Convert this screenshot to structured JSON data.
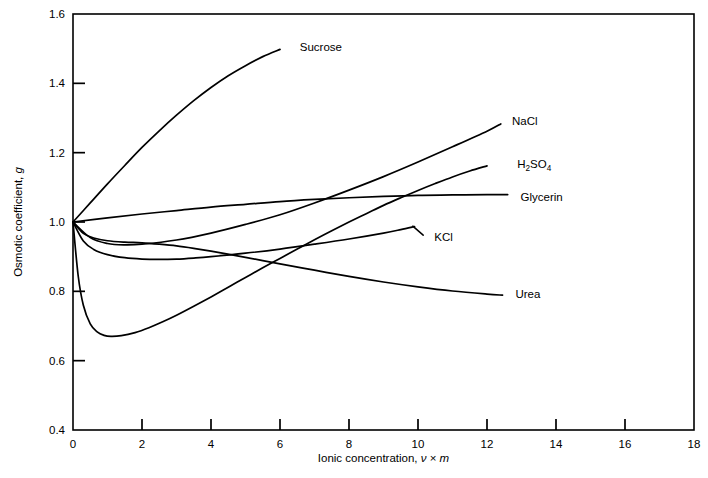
{
  "chart_data": {
    "type": "line",
    "title": "",
    "xlabel": "Ionic concentration, ν × m",
    "ylabel": "Osmotic coefficient, g",
    "xlim": [
      0,
      18
    ],
    "ylim": [
      0.4,
      1.6
    ],
    "xticks": [
      0,
      2,
      4,
      6,
      8,
      10,
      12,
      14,
      16,
      18
    ],
    "yticks": [
      0.4,
      0.6,
      0.8,
      1.0,
      1.2,
      1.4,
      1.6
    ],
    "xtick_labels": [
      "0",
      "2",
      "4",
      "6",
      "8",
      "10",
      "12",
      "14",
      "16",
      "18"
    ],
    "ytick_labels": [
      "0.4",
      "0.6",
      "0.8",
      "1.0",
      "1.2",
      "1.4",
      "1.6"
    ],
    "grid": false,
    "legend_position": "inline-labels-at-curve-ends",
    "line_color": "#000000",
    "series": [
      {
        "name": "Sucrose",
        "label": "Sucrose",
        "label_x": 6.4,
        "label_y": 1.505,
        "leader": false,
        "points": [
          [
            0.0,
            1.0
          ],
          [
            0.5,
            1.055
          ],
          [
            1.0,
            1.11
          ],
          [
            1.5,
            1.163
          ],
          [
            2.0,
            1.215
          ],
          [
            2.5,
            1.263
          ],
          [
            3.0,
            1.308
          ],
          [
            3.5,
            1.35
          ],
          [
            4.0,
            1.388
          ],
          [
            4.5,
            1.422
          ],
          [
            5.0,
            1.451
          ],
          [
            5.5,
            1.477
          ],
          [
            6.0,
            1.498
          ]
        ]
      },
      {
        "name": "NaCl",
        "label": "NaCl",
        "label_x": 12.55,
        "label_y": 1.292,
        "leader": false,
        "points": [
          [
            0.0,
            1.0
          ],
          [
            0.5,
            0.955
          ],
          [
            1.0,
            0.938
          ],
          [
            1.5,
            0.934
          ],
          [
            2.0,
            0.936
          ],
          [
            3.0,
            0.948
          ],
          [
            4.0,
            0.968
          ],
          [
            5.0,
            0.993
          ],
          [
            6.0,
            1.021
          ],
          [
            7.0,
            1.055
          ],
          [
            8.0,
            1.092
          ],
          [
            9.0,
            1.131
          ],
          [
            10.0,
            1.173
          ],
          [
            11.0,
            1.217
          ],
          [
            12.0,
            1.262
          ],
          [
            12.4,
            1.283
          ]
        ]
      },
      {
        "name": "H2SO4",
        "label": "H₂SO₄",
        "label_html": "H<sub>2</sub>SO<sub>4</sub>",
        "label_x": 12.7,
        "label_y": 1.168,
        "leader": false,
        "points": [
          [
            0.0,
            1.0
          ],
          [
            0.15,
            0.845
          ],
          [
            0.3,
            0.76
          ],
          [
            0.5,
            0.706
          ],
          [
            0.7,
            0.683
          ],
          [
            0.9,
            0.673
          ],
          [
            1.1,
            0.67
          ],
          [
            1.4,
            0.672
          ],
          [
            1.8,
            0.681
          ],
          [
            2.2,
            0.695
          ],
          [
            2.6,
            0.712
          ],
          [
            3.0,
            0.731
          ],
          [
            3.5,
            0.757
          ],
          [
            4.0,
            0.784
          ],
          [
            4.5,
            0.812
          ],
          [
            5.0,
            0.84
          ],
          [
            5.5,
            0.868
          ],
          [
            6.0,
            0.895
          ],
          [
            6.5,
            0.922
          ],
          [
            7.0,
            0.949
          ],
          [
            7.5,
            0.975
          ],
          [
            8.0,
            1.0
          ],
          [
            8.5,
            1.024
          ],
          [
            9.0,
            1.048
          ],
          [
            9.5,
            1.07
          ],
          [
            10.0,
            1.091
          ],
          [
            10.5,
            1.111
          ],
          [
            11.0,
            1.13
          ],
          [
            11.5,
            1.147
          ],
          [
            12.0,
            1.162
          ]
        ]
      },
      {
        "name": "Glycerin",
        "label": "Glycerin",
        "label_x": 12.8,
        "label_y": 1.073,
        "leader": false,
        "points": [
          [
            0.0,
            1.0
          ],
          [
            1.0,
            1.012
          ],
          [
            2.0,
            1.023
          ],
          [
            3.0,
            1.033
          ],
          [
            4.0,
            1.043
          ],
          [
            5.0,
            1.051
          ],
          [
            6.0,
            1.059
          ],
          [
            7.0,
            1.065
          ],
          [
            8.0,
            1.07
          ],
          [
            9.0,
            1.074
          ],
          [
            10.0,
            1.077
          ],
          [
            11.0,
            1.078
          ],
          [
            12.0,
            1.079
          ],
          [
            12.6,
            1.079
          ]
        ]
      },
      {
        "name": "KCl",
        "label": "KCl",
        "label_x": 10.3,
        "label_y": 0.957,
        "leader": true,
        "leader_from": [
          9.85,
          0.988
        ],
        "leader_to": [
          10.15,
          0.962
        ],
        "points": [
          [
            0.0,
            1.0
          ],
          [
            0.3,
            0.945
          ],
          [
            0.6,
            0.921
          ],
          [
            1.0,
            0.906
          ],
          [
            1.5,
            0.897
          ],
          [
            2.0,
            0.893
          ],
          [
            2.5,
            0.892
          ],
          [
            3.0,
            0.893
          ],
          [
            3.5,
            0.896
          ],
          [
            4.0,
            0.9
          ],
          [
            5.0,
            0.91
          ],
          [
            6.0,
            0.922
          ],
          [
            7.0,
            0.936
          ],
          [
            8.0,
            0.951
          ],
          [
            9.0,
            0.968
          ],
          [
            9.5,
            0.978
          ],
          [
            9.9,
            0.987
          ]
        ]
      },
      {
        "name": "Urea",
        "label": "Urea",
        "label_x": 12.65,
        "label_y": 0.793,
        "leader": false,
        "points": [
          [
            0.0,
            1.0
          ],
          [
            0.3,
            0.967
          ],
          [
            0.6,
            0.954
          ],
          [
            1.0,
            0.946
          ],
          [
            1.5,
            0.942
          ],
          [
            2.0,
            0.94
          ],
          [
            2.5,
            0.936
          ],
          [
            3.0,
            0.931
          ],
          [
            3.5,
            0.924
          ],
          [
            4.0,
            0.916
          ],
          [
            5.0,
            0.898
          ],
          [
            6.0,
            0.879
          ],
          [
            7.0,
            0.861
          ],
          [
            8.0,
            0.843
          ],
          [
            9.0,
            0.827
          ],
          [
            10.0,
            0.813
          ],
          [
            11.0,
            0.801
          ],
          [
            12.0,
            0.792
          ],
          [
            12.45,
            0.789
          ]
        ]
      }
    ]
  }
}
